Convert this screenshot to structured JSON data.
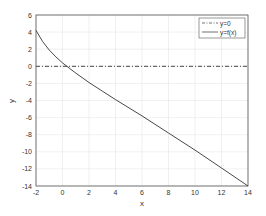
{
  "chart_data": {
    "type": "line",
    "title": "",
    "xlabel": "x",
    "ylabel": "y",
    "xlim": [
      -2,
      14
    ],
    "ylim": [
      -14,
      6
    ],
    "xticks": [
      -2,
      0,
      2,
      4,
      6,
      8,
      10,
      12,
      14
    ],
    "yticks": [
      -14,
      -12,
      -10,
      -8,
      -6,
      -4,
      -2,
      0,
      2,
      4,
      6
    ],
    "grid": true,
    "legend_position": "upper right",
    "series": [
      {
        "name": "y=0",
        "style": "dash-dot",
        "x": [
          -2,
          14
        ],
        "y": [
          0,
          0
        ]
      },
      {
        "name": "y=f(x)",
        "style": "solid",
        "x": [
          -2,
          -1.5,
          -1,
          -0.5,
          0,
          0.5,
          1,
          2,
          3,
          4,
          6,
          8,
          10,
          12,
          14
        ],
        "y": [
          4.2,
          2.9,
          1.9,
          1.1,
          0.4,
          -0.2,
          -0.8,
          -1.9,
          -2.9,
          -3.9,
          -5.8,
          -7.8,
          -9.8,
          -11.9,
          -14
        ]
      }
    ]
  },
  "labels": {
    "x": "x",
    "y": "y",
    "legend": [
      "y=0",
      "y=f(x)"
    ]
  }
}
